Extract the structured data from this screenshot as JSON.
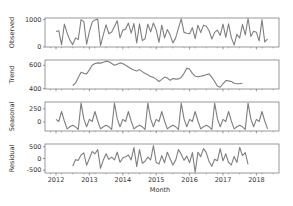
{
  "chart_data": {
    "type": "line",
    "title": "",
    "xlabel": "Month",
    "x_ticks": [
      "2012",
      "2013",
      "2014",
      "2015",
      "2016",
      "2017",
      "2018"
    ],
    "x_start": "2012-01",
    "line_color": "#7f7f7f",
    "panels": [
      {
        "name": "Observed",
        "ylabel": "Observed",
        "yticks": [
          0,
          1000
        ],
        "ylim": [
          0,
          1050
        ],
        "start_index": 0,
        "values": [
          560,
          590,
          80,
          830,
          500,
          250,
          80,
          330,
          270,
          990,
          920,
          100,
          560,
          900,
          980,
          1010,
          50,
          450,
          800,
          480,
          540,
          740,
          950,
          330,
          610,
          640,
          870,
          500,
          850,
          150,
          840,
          230,
          300,
          830,
          550,
          870,
          620,
          170,
          790,
          330,
          630,
          430,
          150,
          330,
          680,
          1020,
          530,
          500,
          480,
          700,
          300,
          790,
          520,
          790,
          750,
          590,
          290,
          530,
          610,
          420,
          830,
          350,
          840,
          340,
          70,
          460,
          330,
          820,
          440,
          1040,
          380,
          570,
          530,
          220,
          990,
          180,
          290
        ]
      },
      {
        "name": "Trend",
        "ylabel": "Trend",
        "yticks": [
          400,
          600
        ],
        "ylim": [
          395,
          645
        ],
        "start_index": 6,
        "values": [
          425,
          445,
          495,
          540,
          530,
          525,
          560,
          600,
          615,
          620,
          618,
          625,
          635,
          630,
          615,
          600,
          608,
          620,
          615,
          600,
          585,
          570,
          558,
          550,
          562,
          545,
          528,
          518,
          502,
          495,
          480,
          460,
          478,
          498,
          490,
          470,
          485,
          480,
          482,
          495,
          530,
          575,
          565,
          530,
          505,
          500,
          505,
          510,
          520,
          525,
          495,
          460,
          420,
          410,
          440,
          468,
          465,
          460,
          445,
          440,
          440,
          445
        ]
      },
      {
        "name": "Seasonal",
        "ylabel": "Seasonal",
        "yticks": [
          0,
          250
        ],
        "ylim": [
          -170,
          380
        ],
        "start_index": 0,
        "cycle": [
          50,
          10,
          200,
          20,
          -130,
          -90,
          -60,
          -90,
          -140,
          360,
          60,
          -90
        ],
        "values": [
          50,
          10,
          200,
          20,
          -130,
          -90,
          -60,
          -90,
          -140,
          360,
          60,
          -90,
          50,
          10,
          200,
          20,
          -130,
          -90,
          -60,
          -90,
          -140,
          360,
          60,
          -90,
          50,
          10,
          200,
          20,
          -130,
          -90,
          -60,
          -90,
          -140,
          360,
          60,
          -90,
          50,
          10,
          200,
          20,
          -130,
          -90,
          -60,
          -90,
          -140,
          360,
          60,
          -90,
          50,
          10,
          200,
          20,
          -130,
          -90,
          -60,
          -90,
          -140,
          360,
          60,
          -90,
          50,
          10,
          200,
          20,
          -130,
          -90,
          -60,
          -90,
          -140,
          360,
          60,
          -90,
          50,
          10,
          200,
          20,
          -130
        ]
      },
      {
        "name": "Residual",
        "ylabel": "Residual",
        "yticks": [
          -500,
          0,
          500
        ],
        "ylim": [
          -620,
          620
        ],
        "start_index": 6,
        "values": [
          -330,
          -50,
          -80,
          150,
          240,
          -290,
          0,
          300,
          200,
          380,
          -420,
          -60,
          200,
          -40,
          60,
          -60,
          270,
          -160,
          20,
          70,
          150,
          -60,
          470,
          -350,
          380,
          -200,
          -120,
          60,
          -60,
          550,
          -170,
          -240,
          120,
          -180,
          270,
          -10,
          -280,
          -70,
          380,
          180,
          -80,
          100,
          -180,
          250,
          -580,
          270,
          80,
          420,
          250,
          -130,
          -330,
          -30,
          -100,
          420,
          -100,
          200,
          -170,
          -270,
          90,
          -170,
          480,
          120,
          250,
          -250
        ]
      }
    ]
  }
}
